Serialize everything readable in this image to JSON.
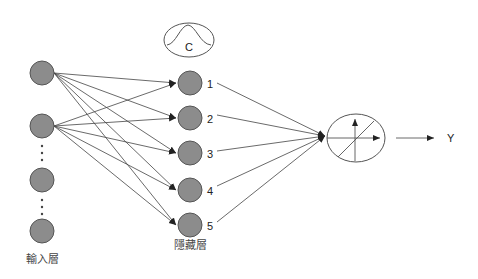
{
  "diagram": {
    "type": "rbf-neural-network",
    "input_layer": {
      "label": "輸入層",
      "nodes": [
        {
          "id": "x1",
          "cx": 42,
          "cy": 73
        },
        {
          "id": "x2",
          "cx": 42,
          "cy": 126
        },
        {
          "id": "x3",
          "cx": 42,
          "cy": 180
        },
        {
          "id": "xn",
          "cx": 42,
          "cy": 231
        }
      ],
      "ellipsis_between": [
        [
          1,
          2
        ],
        [
          2,
          3
        ]
      ]
    },
    "hidden_layer": {
      "label": "隱藏層",
      "nodes": [
        {
          "id": "h1",
          "label": "1",
          "cx": 190,
          "cy": 83
        },
        {
          "id": "h2",
          "label": "2",
          "cx": 190,
          "cy": 118
        },
        {
          "id": "h3",
          "label": "3",
          "cx": 190,
          "cy": 153
        },
        {
          "id": "h4",
          "label": "4",
          "cx": 190,
          "cy": 190
        },
        {
          "id": "h5",
          "label": "5",
          "cx": 190,
          "cy": 225
        }
      ],
      "kernel_symbol": {
        "label": "C",
        "shape": "gaussian-bump-in-ellipse"
      }
    },
    "output_unit": {
      "shape": "ellipse-with-axes",
      "cx": 356,
      "cy": 138
    },
    "output": {
      "label": "Y"
    },
    "edges": {
      "input_to_hidden": "input nodes 1 and 2 connect to all 5 hidden nodes with arrows",
      "hidden_to_output": "each hidden node (1-5) connects to the output unit"
    }
  }
}
